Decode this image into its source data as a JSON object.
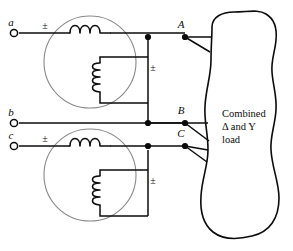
{
  "figure": {
    "background_color": "#ffffff",
    "line_color": "#0b0b0b",
    "core_color": "#8a8a8a"
  },
  "source_terminals": [
    {
      "id": "a",
      "label": "a",
      "x": 14,
      "y": 33,
      "label_x": 11,
      "label_y": 26
    },
    {
      "id": "b",
      "label": "b",
      "x": 14,
      "y": 123,
      "label_x": 11,
      "label_y": 116
    },
    {
      "id": "c",
      "label": "c",
      "x": 14,
      "y": 146,
      "label_x": 11,
      "label_y": 139
    }
  ],
  "load_terminals": [
    {
      "id": "A",
      "label": "A",
      "x": 185,
      "y": 37,
      "label_x": 181,
      "label_y": 28
    },
    {
      "id": "B",
      "label": "B",
      "x": 185,
      "y": 123,
      "label_x": 181,
      "label_y": 114
    },
    {
      "id": "C",
      "label": "C",
      "x": 185,
      "y": 146,
      "label_x": 181,
      "label_y": 137
    }
  ],
  "polarity_marks": [
    {
      "id": "primary-top",
      "label": "±",
      "x": 45,
      "y": 29
    },
    {
      "id": "secondary-top",
      "label": "±",
      "x": 153,
      "y": 71
    },
    {
      "id": "primary-bottom",
      "label": "±",
      "x": 45,
      "y": 142
    },
    {
      "id": "secondary-bottom",
      "label": "±",
      "x": 153,
      "y": 184
    }
  ],
  "transformer_cores": [
    {
      "id": "top-core",
      "cx": 90,
      "cy": 62,
      "r": 46
    },
    {
      "id": "bottom-core",
      "cx": 90,
      "cy": 175,
      "r": 46
    }
  ],
  "windings": [
    {
      "id": "top-primary",
      "orientation": "horizontal",
      "turns": 3
    },
    {
      "id": "top-secondary",
      "orientation": "vertical",
      "turns": 4
    },
    {
      "id": "bottom-primary",
      "orientation": "horizontal",
      "turns": 3
    },
    {
      "id": "bottom-secondary",
      "orientation": "vertical",
      "turns": 4
    }
  ],
  "junction_dots": [
    {
      "id": "dot-top-secondary-tap",
      "x": 148,
      "y": 37
    },
    {
      "id": "dot-A",
      "x": 185,
      "y": 37
    },
    {
      "id": "dot-B-bus",
      "x": 148,
      "y": 123
    },
    {
      "id": "dot-B",
      "x": 185,
      "y": 123
    },
    {
      "id": "dot-bottom-secondary-tap",
      "x": 148,
      "y": 146
    },
    {
      "id": "dot-C",
      "x": 185,
      "y": 146
    }
  ],
  "load": {
    "name": "combined-load",
    "lines": [
      "Combined",
      "Δ and Y",
      "load"
    ],
    "text_x": 222,
    "text_y_start": 117,
    "line_height": 13
  }
}
